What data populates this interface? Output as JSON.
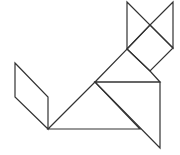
{
  "figure": {
    "stroke_color": "#333333",
    "background": "#ffffff",
    "pieces": [
      {
        "name": "ear-left-triangle",
        "points": "127,2 150,25 127,49"
      },
      {
        "name": "ear-right-triangle",
        "points": "173,2 173,48 150,25"
      },
      {
        "name": "head-square",
        "points": "127,49 150,25 173,48 150,71"
      },
      {
        "name": "neck-triangle",
        "points": "127,49 150,71 160,82 95,82"
      },
      {
        "name": "body-large-triangle",
        "points": "95,82 48,129 140,129"
      },
      {
        "name": "body-right-triangle",
        "points": "95,82 160,82 160,148"
      },
      {
        "name": "tail-parallelogram",
        "points": "15,63 48,97 48,129 15,97"
      }
    ]
  }
}
